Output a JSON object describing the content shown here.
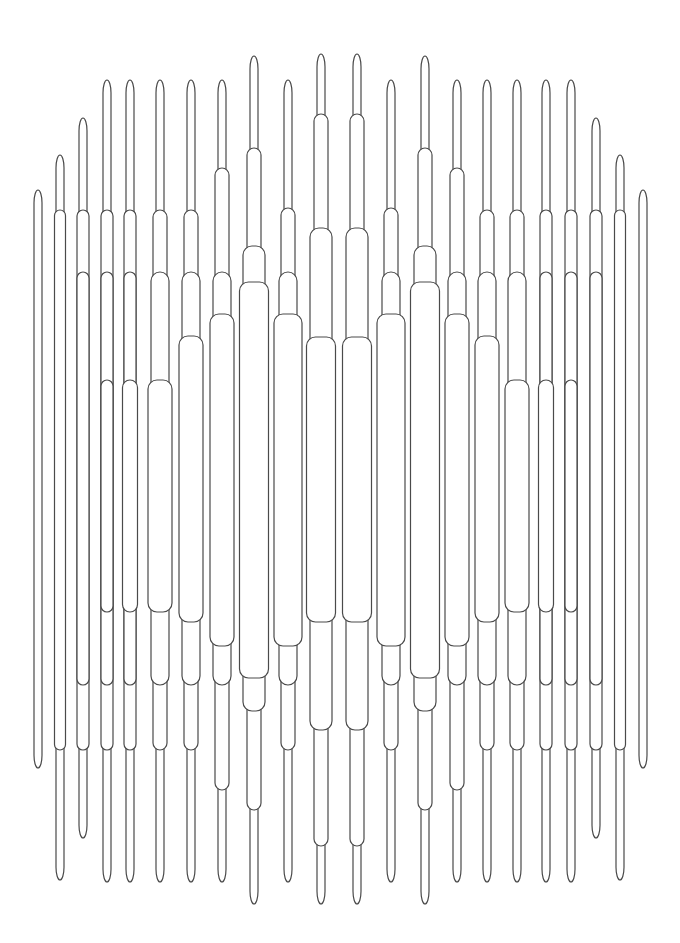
{
  "artwork": {
    "title": "",
    "stroke_color": "#4a4a4a",
    "background": "#ffffff",
    "description": "Symmetric vertical line-art pattern of nested capsule shapes"
  },
  "columns": [
    {
      "x": 38,
      "segments": [
        [
          8,
          190,
          768
        ]
      ]
    },
    {
      "x": 60,
      "segments": [
        [
          8,
          155,
          880
        ],
        [
          11,
          210,
          750
        ]
      ]
    },
    {
      "x": 83,
      "segments": [
        [
          8,
          118,
          838
        ],
        [
          12,
          210,
          750
        ],
        [
          12,
          272,
          685
        ]
      ]
    },
    {
      "x": 107,
      "segments": [
        [
          8,
          80,
          882
        ],
        [
          12,
          210,
          750
        ],
        [
          12,
          272,
          685
        ],
        [
          12,
          380,
          612
        ]
      ]
    },
    {
      "x": 130,
      "segments": [
        [
          8,
          80,
          882
        ],
        [
          12,
          210,
          750
        ],
        [
          12,
          272,
          685
        ],
        [
          15,
          380,
          612
        ]
      ]
    },
    {
      "x": 160,
      "segments": [
        [
          8,
          80,
          882
        ],
        [
          14,
          210,
          750
        ],
        [
          18,
          272,
          685
        ],
        [
          24,
          380,
          612
        ]
      ]
    },
    {
      "x": 191,
      "segments": [
        [
          8,
          80,
          882
        ],
        [
          14,
          210,
          750
        ],
        [
          18,
          272,
          685
        ],
        [
          24,
          336,
          622
        ]
      ]
    },
    {
      "x": 222,
      "segments": [
        [
          8,
          80,
          882
        ],
        [
          14,
          168,
          790
        ],
        [
          18,
          272,
          685
        ],
        [
          24,
          314,
          646
        ]
      ]
    },
    {
      "x": 254,
      "segments": [
        [
          8,
          56,
          904
        ],
        [
          14,
          148,
          810
        ],
        [
          22,
          246,
          711
        ],
        [
          29,
          282,
          678
        ]
      ]
    },
    {
      "x": 288,
      "segments": [
        [
          8,
          80,
          882
        ],
        [
          14,
          208,
          750
        ],
        [
          18,
          272,
          685
        ],
        [
          28,
          314,
          646
        ]
      ]
    },
    {
      "x": 321,
      "segments": [
        [
          8,
          54,
          904
        ],
        [
          14,
          114,
          846
        ],
        [
          22,
          228,
          730
        ],
        [
          29,
          337,
          622
        ]
      ]
    },
    {
      "x": 357,
      "segments": [
        [
          8,
          54,
          904
        ],
        [
          14,
          114,
          846
        ],
        [
          22,
          228,
          730
        ],
        [
          29,
          337,
          622
        ]
      ]
    },
    {
      "x": 391,
      "segments": [
        [
          8,
          80,
          882
        ],
        [
          14,
          208,
          750
        ],
        [
          18,
          272,
          685
        ],
        [
          28,
          314,
          646
        ]
      ]
    },
    {
      "x": 425,
      "segments": [
        [
          8,
          56,
          904
        ],
        [
          14,
          148,
          810
        ],
        [
          22,
          246,
          711
        ],
        [
          29,
          282,
          678
        ]
      ]
    },
    {
      "x": 457,
      "segments": [
        [
          8,
          80,
          882
        ],
        [
          14,
          168,
          790
        ],
        [
          18,
          272,
          685
        ],
        [
          24,
          314,
          646
        ]
      ]
    },
    {
      "x": 487,
      "segments": [
        [
          8,
          80,
          882
        ],
        [
          14,
          210,
          750
        ],
        [
          18,
          272,
          685
        ],
        [
          24,
          336,
          622
        ]
      ]
    },
    {
      "x": 517,
      "segments": [
        [
          8,
          80,
          882
        ],
        [
          14,
          210,
          750
        ],
        [
          18,
          272,
          685
        ],
        [
          24,
          380,
          612
        ]
      ]
    },
    {
      "x": 546,
      "segments": [
        [
          8,
          80,
          882
        ],
        [
          12,
          210,
          750
        ],
        [
          12,
          272,
          685
        ],
        [
          15,
          380,
          612
        ]
      ]
    },
    {
      "x": 571,
      "segments": [
        [
          8,
          80,
          882
        ],
        [
          12,
          210,
          750
        ],
        [
          12,
          272,
          685
        ],
        [
          12,
          380,
          612
        ]
      ]
    },
    {
      "x": 596,
      "segments": [
        [
          8,
          118,
          838
        ],
        [
          12,
          210,
          750
        ],
        [
          12,
          272,
          685
        ]
      ]
    },
    {
      "x": 620,
      "segments": [
        [
          8,
          155,
          880
        ],
        [
          11,
          210,
          750
        ]
      ]
    },
    {
      "x": 643,
      "segments": [
        [
          8,
          190,
          768
        ]
      ]
    }
  ]
}
